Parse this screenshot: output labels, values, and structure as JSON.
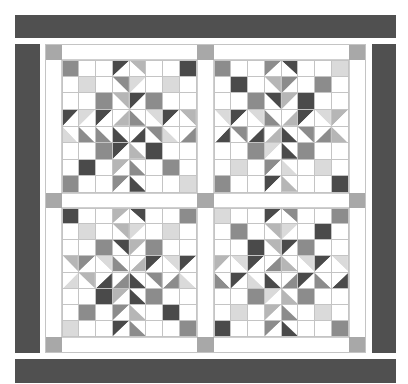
{
  "quilt": {
    "palette": {
      "W": "#ffffff",
      "X": "#dadada",
      "L": "#b6b6b6",
      "M": "#8c8c8c",
      "D": "#4a4a4a",
      "border": "#505050",
      "corner": "#a8a8a8",
      "grid": "#c4c4c4"
    },
    "blocks": [
      {
        "name": "block-top-left",
        "cells": [
          [
            "M",
            "W",
            "W",
            "tri:tl:D:W",
            "tri:tr:L:W",
            "W",
            "W",
            "D"
          ],
          [
            "W",
            "X",
            "W",
            "tri:bl:W:M",
            "tri:br:W:X",
            "W",
            "X",
            "W"
          ],
          [
            "W",
            "W",
            "M",
            "tri:bl:W:L",
            "tri:br:W:D",
            "M",
            "W",
            "W"
          ],
          [
            "tri:tl:D:W",
            "tri:br:W:X",
            "tri:tl:D:W",
            "tri:br:L:W",
            "tri:bl:M:W",
            "tri:tr:X:W",
            "tri:tl:D:W",
            "tri:tr:L:W"
          ],
          [
            "tri:bl:X:W",
            "tri:tr:W:M",
            "tri:bl:M:W",
            "tri:tr:W:D",
            "tri:tl:W:D",
            "tri:bl:W:M",
            "tri:bl:X:W",
            "tri:br:M:W"
          ],
          [
            "W",
            "W",
            "M",
            "tri:tl:D:W",
            "tri:tr:W:L",
            "D",
            "W",
            "W"
          ],
          [
            "W",
            "D",
            "W",
            "tri:tl:L:W",
            "tri:tr:W:M",
            "W",
            "M",
            "W"
          ],
          [
            "M",
            "W",
            "W",
            "tri:tl:M:W",
            "tri:tr:W:D",
            "W",
            "W",
            "X"
          ]
        ]
      },
      {
        "name": "block-top-right",
        "cells": [
          [
            "M",
            "W",
            "W",
            "tri:tl:M:W",
            "tri:tr:D:W",
            "W",
            "W",
            "X"
          ],
          [
            "W",
            "D",
            "W",
            "tri:bl:W:L",
            "tri:br:W:M",
            "W",
            "M",
            "W"
          ],
          [
            "W",
            "W",
            "M",
            "tri:bl:W:D",
            "tri:br:W:L",
            "D",
            "W",
            "W"
          ],
          [
            "tri:tr:X:W",
            "tri:tl:D:W",
            "tri:tr:X:W",
            "tri:bl:M:W",
            "tri:br:L:W",
            "tri:tl:D:W",
            "tri:tr:X:W",
            "tri:tl:L:W"
          ],
          [
            "tri:br:D:W",
            "tri:bl:W:M",
            "tri:br:D:W",
            "tri:tl:W:L",
            "tri:tr:W:D",
            "tri:bl:W:M",
            "tri:br:M:W",
            "tri:bl:L:W"
          ],
          [
            "W",
            "W",
            "M",
            "tri:tl:X:W",
            "tri:tr:W:D",
            "M",
            "W",
            "W"
          ],
          [
            "W",
            "X",
            "W",
            "tri:tl:M:W",
            "tri:tr:W:X",
            "W",
            "X",
            "W"
          ],
          [
            "M",
            "W",
            "W",
            "tri:tl:D:W",
            "tri:tr:W:L",
            "W",
            "W",
            "D"
          ]
        ]
      },
      {
        "name": "block-bottom-left",
        "cells": [
          [
            "D",
            "W",
            "W",
            "tri:tl:L:W",
            "tri:tr:D:W",
            "W",
            "W",
            "M"
          ],
          [
            "W",
            "X",
            "W",
            "tri:bl:W:L",
            "tri:br:W:X",
            "W",
            "X",
            "W"
          ],
          [
            "W",
            "W",
            "M",
            "tri:bl:W:D",
            "tri:br:W:L",
            "M",
            "W",
            "W"
          ],
          [
            "tri:tr:L:W",
            "tri:tl:M:W",
            "tri:tr:X:W",
            "tri:bl:M:W",
            "tri:br:L:W",
            "tri:tl:D:W",
            "tri:tr:X:W",
            "tri:tl:D:W"
          ],
          [
            "tri:br:X:W",
            "tri:bl:W:L",
            "tri:br:D:W",
            "tri:tl:W:M",
            "tri:tr:W:D",
            "tri:bl:W:M",
            "tri:br:M:W",
            "tri:bl:X:W"
          ],
          [
            "W",
            "W",
            "D",
            "tri:tl:L:W",
            "tri:tr:W:D",
            "M",
            "W",
            "W"
          ],
          [
            "W",
            "M",
            "W",
            "tri:tl:M:W",
            "tri:tr:W:L",
            "W",
            "D",
            "W"
          ],
          [
            "X",
            "W",
            "W",
            "tri:tl:D:W",
            "tri:tr:W:M",
            "W",
            "W",
            "M"
          ]
        ]
      },
      {
        "name": "block-bottom-right",
        "cells": [
          [
            "X",
            "W",
            "W",
            "tri:tl:D:W",
            "tri:tr:M:W",
            "W",
            "W",
            "M"
          ],
          [
            "W",
            "M",
            "W",
            "tri:bl:W:L",
            "tri:br:W:X",
            "W",
            "D",
            "W"
          ],
          [
            "W",
            "W",
            "D",
            "tri:bl:W:L",
            "tri:br:W:D",
            "M",
            "W",
            "W"
          ],
          [
            "tri:tl:L:W",
            "tri:tr:X:W",
            "tri:tl:D:W",
            "tri:br:M:W",
            "tri:bl:L:W",
            "tri:tr:X:W",
            "tri:tl:D:W",
            "tri:tr:X:W"
          ],
          [
            "tri:bl:M:W",
            "tri:br:W:D",
            "tri:bl:X:W",
            "tri:tr:W:D",
            "tri:tl:W:M",
            "tri:br:W:D",
            "tri:bl:M:W",
            "tri:br:D:W"
          ],
          [
            "W",
            "W",
            "M",
            "tri:tl:X:W",
            "tri:tr:W:L",
            "M",
            "W",
            "W"
          ],
          [
            "W",
            "X",
            "W",
            "tri:tl:L:W",
            "tri:tr:W:M",
            "W",
            "X",
            "W"
          ],
          [
            "D",
            "W",
            "W",
            "tri:tl:M:W",
            "tri:tr:W:D",
            "W",
            "W",
            "M"
          ]
        ]
      }
    ]
  }
}
